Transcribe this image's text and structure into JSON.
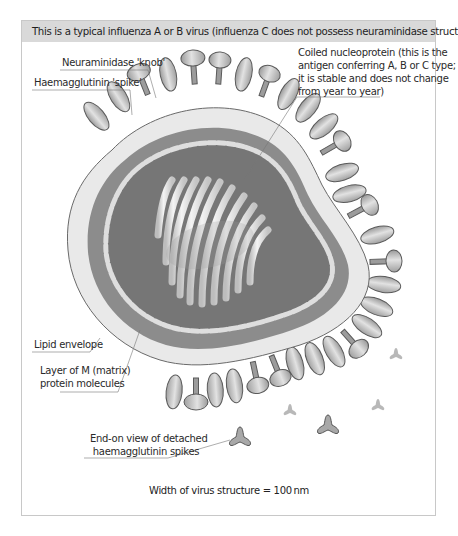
{
  "figure": {
    "header": "This is a typical influenza A or B virus (influenza C does not possess neuraminidase structures)",
    "labels": {
      "neuraminidase": "Neuraminidase 'knob'",
      "haemagglutinin": "Haemagglutinin 'spike'",
      "nucleoprotein_line1": "Coiled nucleoprotein (this is the",
      "nucleoprotein_line2": "antigen conferring A, B or C type;",
      "nucleoprotein_line3": "it is stable and does not change",
      "nucleoprotein_line4": "from year to year)",
      "lipid": "Lipid envelope",
      "matrix_line1": "Layer of M (matrix)",
      "matrix_line2": "protein molecules",
      "detached_line1": "End-on view of detached",
      "detached_line2": "haemagglutinin spikes"
    },
    "footer": "Width of virus structure = 100 nm",
    "colors": {
      "header_bg": "#d9d9d9",
      "envelope": "#e9e9e9",
      "outer_band": "#8c8c8c",
      "inner_core": "#777777",
      "beads": "#dcdcdc",
      "spike": "#b8b8b8",
      "frame_border": "#c8c8c8"
    }
  }
}
